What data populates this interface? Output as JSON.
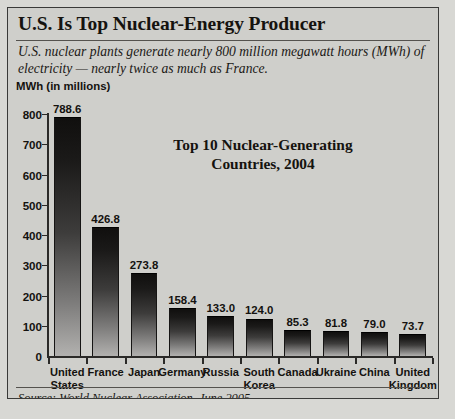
{
  "headline": "U.S. Is Top Nuclear-Energy Producer",
  "deck": "U.S. nuclear plants generate nearly 800 million megawatt hours (MWh) of  electricity — nearly twice as much as France.",
  "source": "Source: World Nuclear Association, June 2005",
  "chart_data": {
    "type": "bar",
    "title": "Top 10 Nuclear-Generating Countries, 2004",
    "title_line1": "Top 10 Nuclear-Generating",
    "title_line2": "Countries, 2004",
    "xlabel": "",
    "ylabel": "MWh (in millions)",
    "ylim": [
      0,
      800
    ],
    "yticks": [
      800,
      700,
      600,
      500,
      400,
      300,
      200,
      100,
      0
    ],
    "ytick_labels": [
      "800",
      "700",
      "600",
      "500",
      "400",
      "300",
      "200",
      "100",
      "0"
    ],
    "grid": false,
    "legend": false,
    "categories": [
      "United States",
      "France",
      "Japan",
      "Germany",
      "Russia",
      "South Korea",
      "Canada",
      "Ukraine",
      "China",
      "United Kingdom"
    ],
    "category_labels": [
      [
        "United",
        "States"
      ],
      [
        "France"
      ],
      [
        "Japan"
      ],
      [
        "Germany"
      ],
      [
        "Russia"
      ],
      [
        "South",
        "Korea"
      ],
      [
        "Canada"
      ],
      [
        "Ukraine"
      ],
      [
        "China"
      ],
      [
        "United",
        "Kingdom"
      ]
    ],
    "values": [
      788.6,
      426.8,
      273.8,
      158.4,
      133.0,
      124.0,
      85.3,
      81.8,
      79.0,
      73.7
    ],
    "value_labels": [
      "788.6",
      "426.8",
      "273.8",
      "158.4",
      "133.0",
      "124.0",
      "85.3",
      "81.8",
      "79.0",
      "73.7"
    ],
    "colors": {
      "bar_top": "#100f0e",
      "bar_bottom": "#b2b1af",
      "axis": "#2b2a28",
      "background": "#cfcfcb",
      "text": "#14120f"
    }
  }
}
